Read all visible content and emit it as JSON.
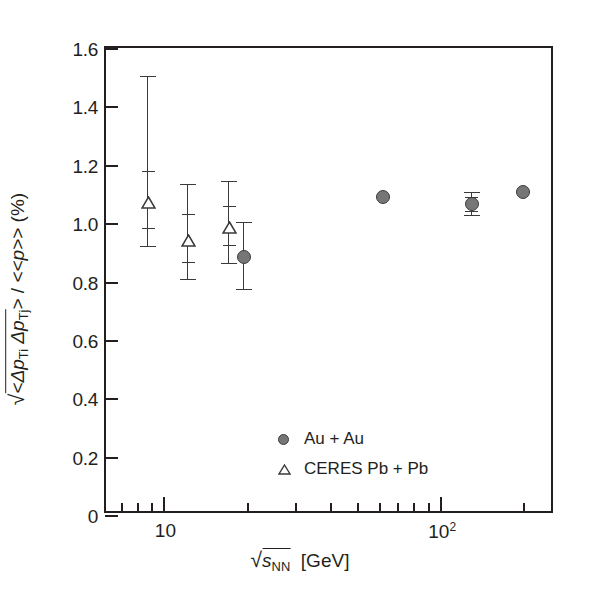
{
  "chart_data": {
    "type": "scatter",
    "title": "",
    "xlabel": "√s_NN [GeV]",
    "ylabel": "√<Δp_Ti Δp_Tj> / <<p>> (%)",
    "xscale": "log",
    "xlim": [
      6.2,
      260
    ],
    "ylim": [
      0,
      1.6
    ],
    "grid": false,
    "legend_position": "inside-lower-left",
    "y_ticks": [
      "0",
      "0.2",
      "0.4",
      "0.6",
      "0.8",
      "1.0",
      "1.2",
      "1.4",
      "1.6"
    ],
    "y_tick_values": [
      0,
      0.2,
      0.4,
      0.6,
      0.8,
      1.0,
      1.2,
      1.4,
      1.6
    ],
    "x_major_ticks": [
      {
        "value": 10,
        "label_base": "10",
        "label_exp": ""
      },
      {
        "value": 100,
        "label_base": "10",
        "label_exp": "2"
      }
    ],
    "x_minor_ticks": [
      7,
      8,
      9,
      20,
      30,
      40,
      50,
      60,
      70,
      80,
      90,
      200
    ],
    "series": [
      {
        "name": "Au + Au",
        "marker": "filled-circle",
        "color": "#767676",
        "points": [
          {
            "x": 19.6,
            "y": 0.885,
            "stat_lo": 0.925,
            "stat_hi": 0.925,
            "sys_lo": 0.775,
            "sys_hi": 1.005
          },
          {
            "x": 62.4,
            "y": 1.09,
            "stat_lo": 1.09,
            "stat_hi": 1.09,
            "sys_lo": 1.09,
            "sys_hi": 1.09
          },
          {
            "x": 130.0,
            "y": 1.065,
            "stat_lo": 1.04,
            "stat_hi": 1.09,
            "sys_lo": 1.028,
            "sys_hi": 1.105
          },
          {
            "x": 200.0,
            "y": 1.105,
            "stat_lo": 1.105,
            "stat_hi": 1.105,
            "sys_lo": 1.105,
            "sys_hi": 1.105
          }
        ]
      },
      {
        "name": "CERES Pb + Pb",
        "marker": "open-triangle",
        "color": "#3a3a3a",
        "points": [
          {
            "x": 8.8,
            "y": 1.075,
            "stat_lo": 0.985,
            "stat_hi": 1.18,
            "sys_lo": 0.92,
            "sys_hi": 1.505
          },
          {
            "x": 12.3,
            "y": 0.945,
            "stat_lo": 0.868,
            "stat_hi": 1.03,
            "sys_lo": 0.81,
            "sys_hi": 1.135
          },
          {
            "x": 17.3,
            "y": 0.99,
            "stat_lo": 0.925,
            "stat_hi": 1.06,
            "sys_lo": 0.865,
            "sys_hi": 1.145
          }
        ]
      }
    ]
  },
  "axes": {
    "y_label_parts": {
      "radical": "√",
      "inner": "<Δp",
      "sub_i": "Ti",
      "inner2": " Δp",
      "sub_j": "Tj",
      "close": ">",
      "divider": " / <<p>> (%)"
    },
    "x_label_parts": {
      "radical": "√",
      "s": "s",
      "sub": "NN",
      "units": "[GeV]"
    }
  },
  "legend": {
    "entries": [
      {
        "label": "Au + Au",
        "marker": "filled-circle"
      },
      {
        "label": "CERES Pb + Pb",
        "marker": "open-triangle"
      }
    ]
  }
}
